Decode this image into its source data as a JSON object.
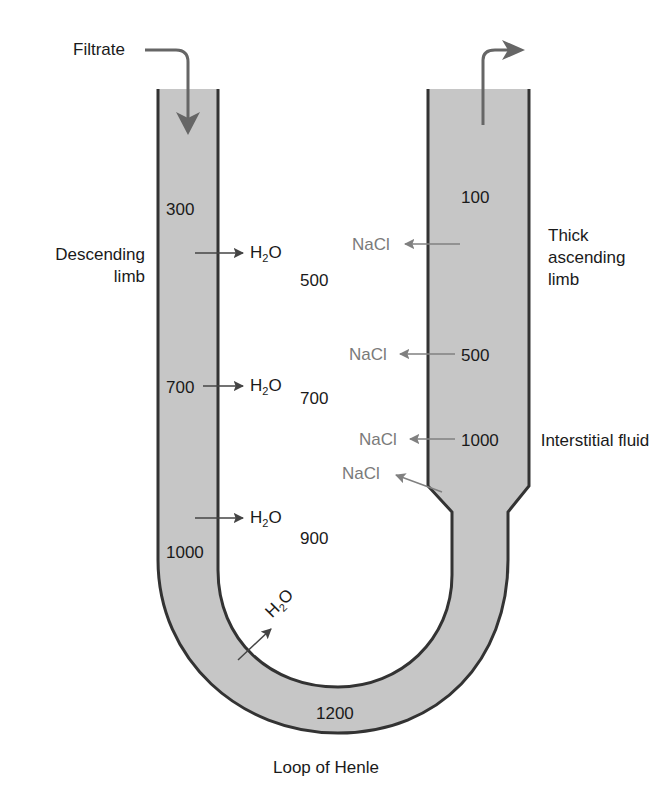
{
  "title": "Loop of Henle",
  "colors": {
    "tube_fill": "#c6c6c6",
    "tube_wall": "#333333",
    "flow_arrow": "#666666",
    "water_arrow": "#444444",
    "nacl_text": "#7a7a7a",
    "text": "#1a1a1a"
  },
  "labels": {
    "filtrate": "Filtrate",
    "descending_limb": "Descending limb",
    "thick_ascending_limb": "Thick ascending limb",
    "interstitial_fluid": "Interstitial fluid",
    "loop_of_henle": "Loop of Henle"
  },
  "tubule_osmolarity": {
    "descending": [
      "300",
      "700",
      "1000"
    ],
    "bottom": "1200",
    "ascending": [
      "500",
      "1000",
      "100"
    ]
  },
  "interstitial_osmolarity": [
    "500",
    "700",
    "900"
  ],
  "water": {
    "symbol": "H",
    "subscript": "2",
    "suffix": "O"
  },
  "salt": "NaCl"
}
